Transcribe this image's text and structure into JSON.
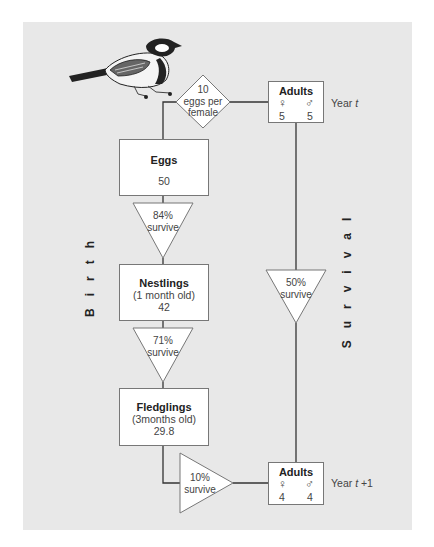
{
  "diagram": {
    "colors": {
      "panel": "#e8e8e8",
      "box_fill": "#ffffff",
      "line": "#333333"
    },
    "decoration": "great-tit-bird-illustration",
    "side_labels": {
      "left": "Birth",
      "right": "Survival"
    },
    "reproduction": {
      "line1": "10",
      "line2": "eggs per",
      "line3": "female"
    },
    "adults_top": {
      "title": "Adults",
      "female_symbol": "♀",
      "male_symbol": "♂",
      "female": "5",
      "male": "5",
      "year_prefix": "Year ",
      "year_var": "t",
      "year_suffix": ""
    },
    "eggs": {
      "title": "Eggs",
      "count": "50"
    },
    "egg_survival": {
      "pct": "84%",
      "label": "survive"
    },
    "nestlings": {
      "title": "Nestlings",
      "age": "(1 month old)",
      "count": "42"
    },
    "nestling_survival": {
      "pct": "71%",
      "label": "survive"
    },
    "fledglings": {
      "title": "Fledglings",
      "age": "(3months old)",
      "count": "29.8"
    },
    "fledgling_survival": {
      "pct": "10%",
      "label": "survive"
    },
    "adult_survival": {
      "pct": "50%",
      "label": "survive"
    },
    "adults_bottom": {
      "title": "Adults",
      "female_symbol": "♀",
      "male_symbol": "♂",
      "female": "4",
      "male": "4",
      "year_prefix": "Year ",
      "year_var": "t",
      "year_suffix": " +1"
    }
  }
}
